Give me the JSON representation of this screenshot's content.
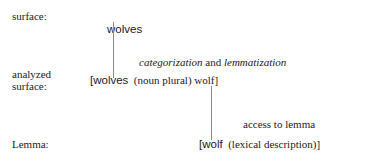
{
  "figure": {
    "background_color": "#ffffff",
    "text_color": "#1a1a1a",
    "connector_color": "#8a8a8a"
  },
  "rows": {
    "surface": {
      "label": "surface:",
      "word": "wolves"
    },
    "analyzed_surface": {
      "label_line1": "analyzed",
      "label_line2": "surface:",
      "bracket_open": "[",
      "word": "wolves",
      "gloss": "  (noun plural) wolf",
      "bracket_close": "]"
    },
    "lemma": {
      "label": "Lemma:",
      "bracket_open": "[",
      "word": "wolf",
      "gloss": "  (lexical description)",
      "bracket_close": "]"
    }
  },
  "processes": {
    "categorization": {
      "term1": "categorization",
      "conjunction": " and ",
      "term2": "lemmatization"
    },
    "access": {
      "text": "access to lemma"
    }
  }
}
